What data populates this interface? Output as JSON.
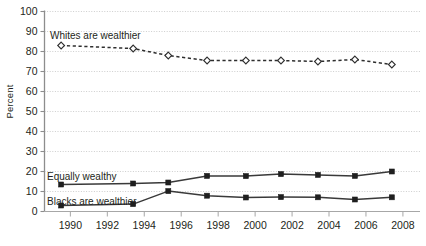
{
  "chart_data": {
    "type": "line",
    "title": "",
    "subtitle": "",
    "xlabel": "",
    "ylabel": "Percent",
    "xlim": [
      1988.6,
      2008.6
    ],
    "ylim": [
      0,
      100
    ],
    "ytick_step": 10,
    "grid": true,
    "legend_position": "inline-annotations",
    "yticks": [
      "0",
      "10",
      "20",
      "30",
      "40",
      "50",
      "60",
      "70",
      "80",
      "90",
      "100"
    ],
    "xticks": [
      "1990",
      "1992",
      "1994",
      "1996",
      "1998",
      "2000",
      "2002",
      "2004",
      "2006",
      "2008"
    ],
    "x": [
      1989.5,
      1993.4,
      1995.3,
      1997.4,
      1999.5,
      2001.4,
      2003.4,
      2005.4,
      2007.4
    ],
    "series": [
      {
        "name": "Whites are wealthier",
        "marker": "open-diamond",
        "linestyle": "dashed",
        "color": "#2e2e2e",
        "values": [
          83,
          81.5,
          78,
          75.5,
          75.5,
          75.5,
          75,
          76,
          73.5
        ],
        "annotation": "Whites are wealthier"
      },
      {
        "name": "Equally wealthy",
        "marker": "filled-square",
        "linestyle": "solid",
        "color": "#3a3a3a",
        "values": [
          13.5,
          14,
          14.5,
          17.8,
          17.7,
          18.7,
          18.3,
          17.8,
          20
        ],
        "annotation": "Equally wealthy"
      },
      {
        "name": "Blacks are wealthier",
        "marker": "filled-square",
        "linestyle": "solid",
        "color": "#3a3a3a",
        "values": [
          3,
          3.7,
          10.2,
          7.9,
          7,
          7.2,
          7.1,
          6,
          7.1
        ],
        "annotation": "Blacks are wealthier"
      }
    ],
    "annotations": [
      {
        "id": "whites",
        "text": "Whites are wealthier",
        "x_px": 50,
        "y_px": 39
      },
      {
        "id": "equally",
        "text": "Equally wealthy",
        "x_px": 47,
        "y_px": 180
      },
      {
        "id": "blacks",
        "text": "Blacks are wealthier",
        "x_px": 47,
        "y_px": 205
      }
    ]
  }
}
